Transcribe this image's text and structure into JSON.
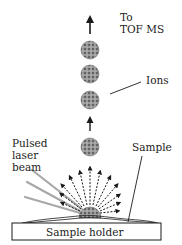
{
  "figure": {
    "labels": {
      "to_line1": "To",
      "to_line2": "TOF MS",
      "ions": "Ions",
      "pulsed_line1": "Pulsed",
      "pulsed_line2": "laser",
      "pulsed_line3": "beam",
      "sample": "Sample",
      "sample_holder": "Sample holder"
    },
    "colors": {
      "ink": "#1a1a1a",
      "ion_fill": "#8a8a8a",
      "laser_beam": "#a8a8a8",
      "background": "#ffffff"
    },
    "components": [
      "upward-arrow",
      "ion-cluster",
      "ion-cluster",
      "ion-cluster",
      "upward-arrow",
      "ion-cluster",
      "desorption-plume",
      "laser-beams",
      "sample-layer",
      "sample-holder"
    ]
  }
}
